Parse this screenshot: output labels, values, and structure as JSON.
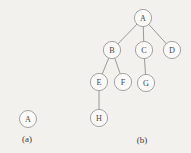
{
  "figure": {
    "background_color": "#f3f1ed",
    "node_fill": "#fbfaf8",
    "node_stroke": "#9a9a98",
    "edge_color": "#8f8f8d",
    "text_color": "#4a4845"
  },
  "panels": [
    {
      "id": "a",
      "caption": "(a)",
      "caption_x": 27,
      "caption_y": 139,
      "nodes": [
        {
          "id": "a-A",
          "label": "A",
          "x": 28,
          "y": 119,
          "r": 8.5
        }
      ],
      "edges": []
    },
    {
      "id": "b",
      "caption": "(b)",
      "caption_x": 142,
      "caption_y": 140,
      "nodes": [
        {
          "id": "b-A",
          "label": "A",
          "x": 143,
          "y": 18,
          "r": 8.6
        },
        {
          "id": "b-B",
          "label": "B",
          "x": 112,
          "y": 50,
          "r": 8.6
        },
        {
          "id": "b-C",
          "label": "C",
          "x": 144,
          "y": 50,
          "r": 8.6
        },
        {
          "id": "b-D",
          "label": "D",
          "x": 172,
          "y": 50,
          "r": 8.6
        },
        {
          "id": "b-E",
          "label": "E",
          "x": 99,
          "y": 82,
          "r": 8.6
        },
        {
          "id": "b-F",
          "label": "F",
          "x": 123,
          "y": 82,
          "r": 8.6
        },
        {
          "id": "b-G",
          "label": "G",
          "x": 146,
          "y": 83,
          "r": 8.6
        },
        {
          "id": "b-H",
          "label": "H",
          "x": 99,
          "y": 118,
          "r": 8.6
        }
      ],
      "edges": [
        {
          "id": "edge-A-B",
          "from": "b-A",
          "to": "b-B"
        },
        {
          "id": "edge-A-C",
          "from": "b-A",
          "to": "b-C"
        },
        {
          "id": "edge-A-D",
          "from": "b-A",
          "to": "b-D"
        },
        {
          "id": "edge-B-E",
          "from": "b-B",
          "to": "b-E"
        },
        {
          "id": "edge-B-F",
          "from": "b-B",
          "to": "b-F"
        },
        {
          "id": "edge-C-G",
          "from": "b-C",
          "to": "b-G"
        },
        {
          "id": "edge-E-H",
          "from": "b-E",
          "to": "b-H"
        }
      ]
    }
  ]
}
